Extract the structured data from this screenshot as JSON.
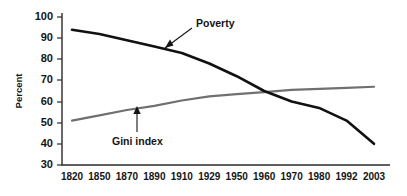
{
  "chart_data": {
    "type": "line",
    "title": "",
    "xlabel": "",
    "ylabel": "Percent",
    "categories": [
      "1820",
      "1850",
      "1870",
      "1890",
      "1910",
      "1929",
      "1950",
      "1960",
      "1970",
      "1980",
      "1992",
      "2003"
    ],
    "ylim": [
      30,
      100
    ],
    "yticks": [
      30,
      40,
      50,
      60,
      70,
      80,
      90,
      100
    ],
    "grid": false,
    "legend": "none",
    "series": [
      {
        "name": "Poverty",
        "color": "#111111",
        "values": [
          94,
          92,
          89,
          86,
          83,
          78,
          72,
          65,
          60,
          57,
          51,
          40
        ]
      },
      {
        "name": "Gini index",
        "color": "#707070",
        "values": [
          51,
          53.5,
          56,
          58,
          60.5,
          62.5,
          63.5,
          64.5,
          65.5,
          66,
          66.5,
          67
        ]
      }
    ],
    "annotations": [
      {
        "text": "Poverty",
        "target_series": "Poverty",
        "arrow": "diagonal-down-left"
      },
      {
        "text": "Gini index",
        "target_series": "Gini index",
        "arrow": "vertical-up"
      }
    ]
  },
  "axes": {
    "y_title": "Percent",
    "y_tick_labels": [
      "100",
      "90",
      "80",
      "70",
      "60",
      "50",
      "40",
      "30"
    ],
    "x_tick_labels": [
      "1820",
      "1850",
      "1870",
      "1890",
      "1910",
      "1929",
      "1950",
      "1960",
      "1970",
      "1980",
      "1992",
      "2003"
    ]
  },
  "labels": {
    "poverty": "Poverty",
    "gini": "Gini index"
  }
}
